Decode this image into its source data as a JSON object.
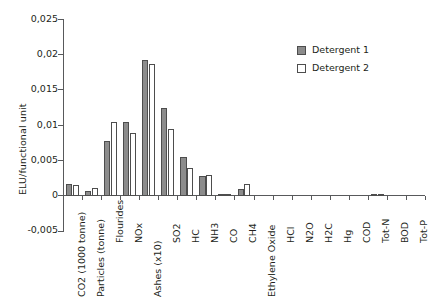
{
  "chart_data": {
    "type": "bar",
    "title": "",
    "xlabel": "",
    "ylabel": "ELU/functional unit",
    "ylim": [
      -0.005,
      0.025
    ],
    "ytick_labels": [
      "0,025",
      "0,02",
      "0,015",
      "0,01",
      "0,005",
      "0",
      "-0,005"
    ],
    "ytick_values": [
      0.025,
      0.02,
      0.015,
      0.01,
      0.005,
      0,
      -0.005
    ],
    "grid": false,
    "legend_position": "top-right",
    "categories": [
      "CO2 (1000 tonne)",
      "Particles (tonne)",
      "Flourides",
      "NOx",
      "Ashes (x10)",
      "SO2",
      "HC",
      "NH3",
      "CO",
      "CH4",
      "Ethylene Oxide",
      "HCl",
      "N2O",
      "H2C",
      "Hg",
      "COD",
      "Tot-N",
      "BOD",
      "Tot-P"
    ],
    "series": [
      {
        "name": "Detergent 1",
        "color": "#8c8c8c",
        "values": [
          0.0017,
          0.0007,
          0.0078,
          0.0105,
          0.0193,
          0.0125,
          0.0055,
          0.0028,
          0.0001,
          0.00105,
          0,
          0,
          0,
          0,
          0,
          0,
          0.0003,
          0,
          0
        ]
      },
      {
        "name": "Detergent 2",
        "color": "#ffffff",
        "values": [
          0.0015,
          0.00115,
          0.01055,
          0.009,
          0.0188,
          0.0095,
          0.004,
          0.003,
          8e-05,
          0.00175,
          0,
          0,
          0,
          0,
          0,
          0,
          0.0001,
          0,
          0
        ]
      }
    ]
  },
  "legend": {
    "entries": [
      {
        "label": "Detergent 1"
      },
      {
        "label": "Detergent 2"
      }
    ]
  }
}
